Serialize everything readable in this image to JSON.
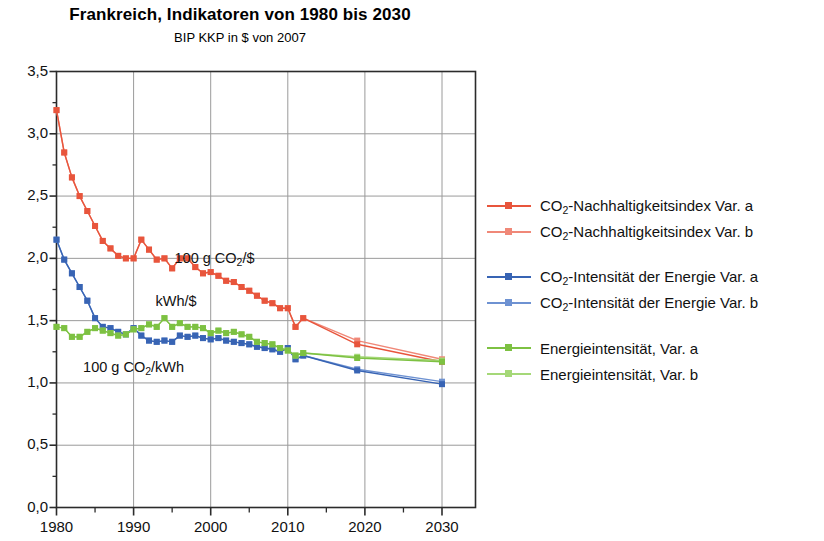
{
  "chart_data": {
    "type": "line",
    "title": "Frankreich, Indikatoren von 1980 bis 2030",
    "subtitle": "BIP KKP in $ von 2007",
    "xlabel": "",
    "ylabel": "",
    "xlim": [
      1980,
      2030
    ],
    "ylim": [
      0.0,
      3.5
    ],
    "xticks": [
      1980,
      1990,
      2000,
      2010,
      2020,
      2030
    ],
    "xtick_labels": [
      "1980",
      "1990",
      "2000",
      "2010",
      "2020",
      "2030"
    ],
    "x_minor_step": 5,
    "yticks": [
      0.0,
      0.5,
      1.0,
      1.5,
      2.0,
      2.5,
      3.0,
      3.5
    ],
    "ytick_labels": [
      "0,0",
      "0,5",
      "1,0",
      "1,5",
      "2,0",
      "2,5",
      "3,0",
      "3,5"
    ],
    "y_minor_step": 0.25,
    "grid": true,
    "legend_position": "right",
    "colors": {
      "red_a": "#E8553C",
      "red_b": "#F08878",
      "blue_a": "#3864B4",
      "blue_b": "#6E92D2",
      "green_a": "#7DC142",
      "green_b": "#A5D878"
    },
    "annotations": [
      {
        "text_html": "100 g CO<sub>2</sub>/$",
        "x": 2000.5,
        "y": 1.99
      },
      {
        "text_html": "kWh/$",
        "x": 1995.5,
        "y": 1.64
      },
      {
        "text_html": "100 g CO<sub>2</sub>/kWh",
        "x": 1990.0,
        "y": 1.11
      }
    ],
    "series": [
      {
        "name": "CO2-Nachhaltigkeitsindex Var. a",
        "color": "#E8553C",
        "x": [
          1980,
          1981,
          1982,
          1983,
          1984,
          1985,
          1986,
          1987,
          1988,
          1989,
          1990,
          1991,
          1992,
          1993,
          1994,
          1995,
          1996,
          1997,
          1998,
          1999,
          2000,
          2001,
          2002,
          2003,
          2004,
          2005,
          2006,
          2007,
          2008,
          2009,
          2010,
          2011,
          2012,
          2019,
          2030
        ],
        "values": [
          3.19,
          2.85,
          2.65,
          2.5,
          2.38,
          2.26,
          2.14,
          2.08,
          2.02,
          2.0,
          2.0,
          2.15,
          2.07,
          1.99,
          2.0,
          1.92,
          2.0,
          2.0,
          1.93,
          1.88,
          1.89,
          1.86,
          1.82,
          1.81,
          1.77,
          1.74,
          1.7,
          1.66,
          1.64,
          1.6,
          1.6,
          1.45,
          1.52,
          1.31,
          1.17
        ]
      },
      {
        "name": "CO2-Nachhaltigkeitsindex Var. b",
        "color": "#F08878",
        "x": [
          1980,
          1981,
          1982,
          1983,
          1984,
          1985,
          1986,
          1987,
          1988,
          1989,
          1990,
          1991,
          1992,
          1993,
          1994,
          1995,
          1996,
          1997,
          1998,
          1999,
          2000,
          2001,
          2002,
          2003,
          2004,
          2005,
          2006,
          2007,
          2008,
          2009,
          2010,
          2011,
          2012,
          2019,
          2030
        ],
        "values": [
          3.19,
          2.85,
          2.65,
          2.5,
          2.38,
          2.26,
          2.14,
          2.08,
          2.02,
          2.0,
          2.0,
          2.15,
          2.07,
          1.99,
          2.0,
          1.92,
          2.0,
          2.0,
          1.93,
          1.88,
          1.89,
          1.86,
          1.82,
          1.81,
          1.77,
          1.74,
          1.7,
          1.66,
          1.64,
          1.6,
          1.6,
          1.45,
          1.52,
          1.34,
          1.19
        ]
      },
      {
        "name": "CO2-Intensitaet der Energie Var. a",
        "color": "#3864B4",
        "x": [
          1980,
          1981,
          1982,
          1983,
          1984,
          1985,
          1986,
          1987,
          1988,
          1989,
          1990,
          1991,
          1992,
          1993,
          1994,
          1995,
          1996,
          1997,
          1998,
          1999,
          2000,
          2001,
          2002,
          2003,
          2004,
          2005,
          2006,
          2007,
          2008,
          2009,
          2010,
          2011,
          2012,
          2019,
          2030
        ],
        "values": [
          2.15,
          1.99,
          1.88,
          1.77,
          1.66,
          1.52,
          1.45,
          1.44,
          1.41,
          1.39,
          1.44,
          1.38,
          1.34,
          1.33,
          1.34,
          1.33,
          1.38,
          1.37,
          1.38,
          1.36,
          1.35,
          1.36,
          1.34,
          1.33,
          1.32,
          1.31,
          1.29,
          1.28,
          1.27,
          1.25,
          1.28,
          1.19,
          1.22,
          1.1,
          0.99
        ]
      },
      {
        "name": "CO2-Intensitaet der Energie Var. b",
        "color": "#6E92D2",
        "x": [
          1980,
          1981,
          1982,
          1983,
          1984,
          1985,
          1986,
          1987,
          1988,
          1989,
          1990,
          1991,
          1992,
          1993,
          1994,
          1995,
          1996,
          1997,
          1998,
          1999,
          2000,
          2001,
          2002,
          2003,
          2004,
          2005,
          2006,
          2007,
          2008,
          2009,
          2010,
          2011,
          2012,
          2019,
          2030
        ],
        "values": [
          2.15,
          1.99,
          1.88,
          1.77,
          1.66,
          1.52,
          1.45,
          1.44,
          1.41,
          1.39,
          1.44,
          1.38,
          1.34,
          1.33,
          1.34,
          1.33,
          1.38,
          1.37,
          1.38,
          1.36,
          1.35,
          1.36,
          1.34,
          1.33,
          1.32,
          1.31,
          1.29,
          1.28,
          1.27,
          1.25,
          1.28,
          1.19,
          1.22,
          1.11,
          1.01
        ]
      },
      {
        "name": "Energieintensitaet, Var. a",
        "color": "#7DC142",
        "x": [
          1980,
          1981,
          1982,
          1983,
          1984,
          1985,
          1986,
          1987,
          1988,
          1989,
          1990,
          1991,
          1992,
          1993,
          1994,
          1995,
          1996,
          1997,
          1998,
          1999,
          2000,
          2001,
          2002,
          2003,
          2004,
          2005,
          2006,
          2007,
          2008,
          2009,
          2010,
          2011,
          2012,
          2019,
          2030
        ],
        "values": [
          1.45,
          1.44,
          1.37,
          1.37,
          1.41,
          1.44,
          1.42,
          1.4,
          1.38,
          1.39,
          1.43,
          1.44,
          1.47,
          1.45,
          1.52,
          1.45,
          1.48,
          1.45,
          1.45,
          1.44,
          1.4,
          1.42,
          1.4,
          1.41,
          1.39,
          1.37,
          1.33,
          1.32,
          1.31,
          1.28,
          1.26,
          1.22,
          1.24,
          1.2,
          1.17
        ]
      },
      {
        "name": "Energieintensitaet, Var. b",
        "color": "#A5D878",
        "x": [
          1980,
          1981,
          1982,
          1983,
          1984,
          1985,
          1986,
          1987,
          1988,
          1989,
          1990,
          1991,
          1992,
          1993,
          1994,
          1995,
          1996,
          1997,
          1998,
          1999,
          2000,
          2001,
          2002,
          2003,
          2004,
          2005,
          2006,
          2007,
          2008,
          2009,
          2010,
          2011,
          2012,
          2019,
          2030
        ],
        "values": [
          1.45,
          1.44,
          1.37,
          1.37,
          1.41,
          1.44,
          1.42,
          1.4,
          1.38,
          1.39,
          1.43,
          1.44,
          1.47,
          1.45,
          1.52,
          1.45,
          1.48,
          1.45,
          1.45,
          1.44,
          1.4,
          1.42,
          1.4,
          1.41,
          1.39,
          1.37,
          1.33,
          1.32,
          1.31,
          1.28,
          1.26,
          1.22,
          1.24,
          1.21,
          1.18
        ]
      }
    ]
  },
  "legend": {
    "groups": [
      {
        "items": [
          {
            "prefix": "CO",
            "sub": "2",
            "suffix": "-Nachhaltigkeitsindex Var. a",
            "color_key": "red_a"
          },
          {
            "prefix": "CO",
            "sub": "2",
            "suffix": "-Nachhaltigkeitsindex Var. b",
            "color_key": "red_b"
          }
        ]
      },
      {
        "items": [
          {
            "prefix": "CO",
            "sub": "2",
            "suffix": "-Intensität der Energie Var. a",
            "color_key": "blue_a"
          },
          {
            "prefix": "CO",
            "sub": "2",
            "suffix": "-Intensität der Energie Var. b",
            "color_key": "blue_b"
          }
        ]
      },
      {
        "items": [
          {
            "prefix": "Energieintensität, Var. a",
            "sub": "",
            "suffix": "",
            "color_key": "green_a"
          },
          {
            "prefix": "Energieintensität, Var. b",
            "sub": "",
            "suffix": "",
            "color_key": "green_b"
          }
        ]
      }
    ]
  }
}
